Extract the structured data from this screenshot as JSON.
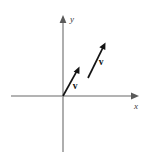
{
  "figure": {
    "background_color": "#ffffff",
    "canvas": {
      "width": 152,
      "height": 161
    }
  },
  "axes": {
    "color": "#9a9a9a",
    "stroke_width": 1.6,
    "origin": {
      "x": 63,
      "y": 96
    },
    "x_axis": {
      "label": "x",
      "label_pos": {
        "x": 136,
        "y": 108
      },
      "start": {
        "x": 11,
        "y": 96
      },
      "end": {
        "x": 139,
        "y": 96
      },
      "arrow_at_end": true
    },
    "y_axis": {
      "label": "y",
      "label_pos": {
        "x": 71,
        "y": 21
      },
      "start": {
        "x": 63,
        "y": 152
      },
      "end": {
        "x": 63,
        "y": 15
      },
      "arrow_at_end": true
    }
  },
  "vectors": {
    "color": "#141414",
    "stroke_width": 1.7,
    "items": [
      {
        "name": "vector-v-origin",
        "label": "v",
        "tail": {
          "x": 63,
          "y": 96
        },
        "head": {
          "x": 79.5,
          "y": 66.5
        },
        "label_pos": {
          "x": 74,
          "y": 88
        }
      },
      {
        "name": "vector-v-translated",
        "label": "v",
        "tail": {
          "x": 88,
          "y": 78
        },
        "head": {
          "x": 105.5,
          "y": 42.5
        },
        "label_pos": {
          "x": 100,
          "y": 64
        }
      }
    ]
  }
}
